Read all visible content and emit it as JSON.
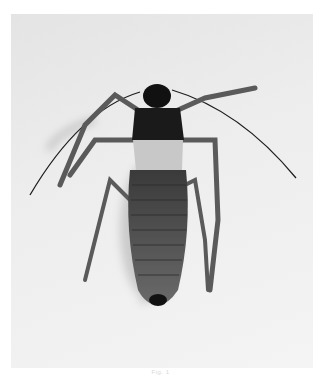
{
  "image": {
    "subject": "insect specimen, dorsal view",
    "style": "grayscale photograph",
    "background_color": "#ececec",
    "subject_color": "#2a2a2a"
  },
  "caption": {
    "text": "Fig. 1"
  }
}
